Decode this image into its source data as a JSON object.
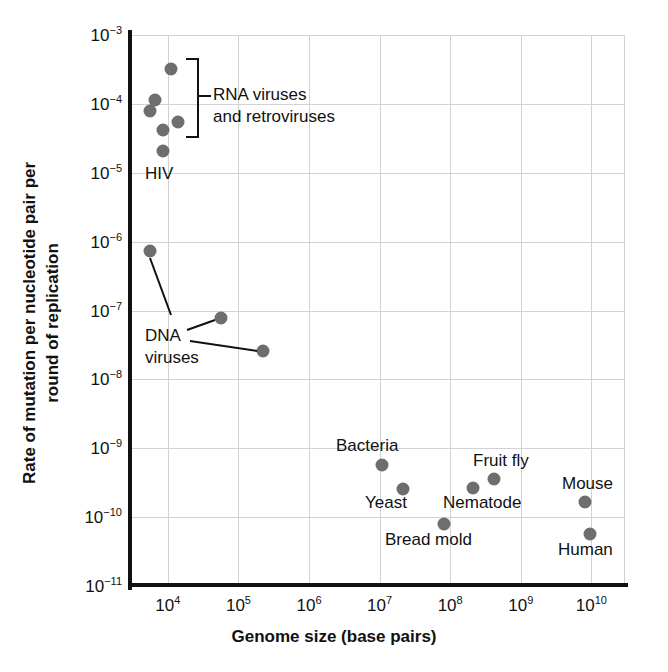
{
  "chart_data": {
    "type": "scatter",
    "title": "",
    "xlabel": "Genome size (base pairs)",
    "ylabel_line1": "Rate of mutation per nucleotide pair per",
    "ylabel_line2": "round of replication",
    "xscale": "log",
    "yscale": "log",
    "xlim": [
      3000,
      30000000000
    ],
    "ylim": [
      1e-11,
      0.001
    ],
    "grid": true,
    "legend": "none",
    "marker_color": "#6e6e6e",
    "xticks": [
      {
        "label": "10",
        "exp": "4",
        "value": 10000
      },
      {
        "label": "10",
        "exp": "5",
        "value": 100000
      },
      {
        "label": "10",
        "exp": "6",
        "value": 1000000
      },
      {
        "label": "10",
        "exp": "7",
        "value": 10000000
      },
      {
        "label": "10",
        "exp": "8",
        "value": 100000000
      },
      {
        "label": "10",
        "exp": "9",
        "value": 1000000000
      },
      {
        "label": "10",
        "exp": "10",
        "value": 10000000000
      }
    ],
    "yticks": [
      {
        "label": "10",
        "exp": "−3",
        "value": 0.001
      },
      {
        "label": "10",
        "exp": "−4",
        "value": 0.0001
      },
      {
        "label": "10",
        "exp": "−5",
        "value": 1e-05
      },
      {
        "label": "10",
        "exp": "−6",
        "value": 1e-06
      },
      {
        "label": "10",
        "exp": "−7",
        "value": 1e-07
      },
      {
        "label": "10",
        "exp": "−8",
        "value": 1e-08
      },
      {
        "label": "10",
        "exp": "−9",
        "value": 1e-09
      },
      {
        "label": "10",
        "exp": "−10",
        "value": 1e-10
      },
      {
        "label": "10",
        "exp": "−11",
        "value": 1e-11
      }
    ],
    "points": [
      {
        "name": "rna-virus-1",
        "group": "RNA viruses and retroviruses",
        "x": 11000,
        "y": 0.00026,
        "px": 171,
        "py": 69
      },
      {
        "name": "rna-virus-2",
        "group": "RNA viruses and retroviruses",
        "x": 7600,
        "y": 0.0001,
        "px": 155,
        "py": 100
      },
      {
        "name": "rna-virus-3",
        "group": "RNA viruses and retroviruses",
        "x": 6600,
        "y": 7.2e-05,
        "px": 150,
        "py": 111
      },
      {
        "name": "rna-virus-4",
        "group": "RNA viruses and retroviruses",
        "x": 9200,
        "y": 3.8e-05,
        "px": 163,
        "py": 130
      },
      {
        "name": "rna-virus-5",
        "group": "RNA viruses and retroviruses",
        "x": 13500,
        "y": 4.9e-05,
        "px": 178,
        "py": 122
      },
      {
        "name": "hiv",
        "group": "HIV",
        "x": 9200,
        "y": 1.9e-05,
        "px": 163,
        "py": 151
      },
      {
        "name": "dna-virus-1",
        "group": "DNA viruses",
        "x": 6600,
        "y": 6e-07,
        "px": 150,
        "py": 251
      },
      {
        "name": "dna-virus-2",
        "group": "DNA viruses",
        "x": 52000,
        "y": 7e-08,
        "px": 221,
        "py": 318
      },
      {
        "name": "dna-virus-3",
        "group": "DNA viruses",
        "x": 185000,
        "y": 2.2e-08,
        "px": 263,
        "py": 351
      },
      {
        "name": "bacteria",
        "group": "Bacteria",
        "x": 5000000,
        "y": 5.1e-10,
        "px": 382,
        "py": 465
      },
      {
        "name": "yeast",
        "group": "Yeast",
        "x": 12000000,
        "y": 2.1e-10,
        "px": 403,
        "py": 489
      },
      {
        "name": "bread-mold",
        "group": "Bread mold",
        "x": 40000000,
        "y": 6.5e-11,
        "px": 444,
        "py": 524
      },
      {
        "name": "nematode",
        "group": "Nematode",
        "x": 100000000,
        "y": 2.1e-10,
        "px": 473,
        "py": 488
      },
      {
        "name": "fruit-fly",
        "group": "Fruit fly",
        "x": 180000000,
        "y": 2.8e-10,
        "px": 494,
        "py": 479
      },
      {
        "name": "mouse",
        "group": "Mouse",
        "x": 2800000000,
        "y": 1.7e-10,
        "px": 585,
        "py": 502
      },
      {
        "name": "human",
        "group": "Human",
        "x": 3000000000,
        "y": 5.3e-11,
        "px": 590,
        "py": 534
      }
    ],
    "annotations": [
      {
        "name": "rna-viruses-label",
        "text_line1": "RNA viruses",
        "text_line2": "and retroviruses",
        "px": 213,
        "py": 84
      },
      {
        "name": "hiv-label",
        "text": "HIV",
        "px": 145,
        "py": 163
      },
      {
        "name": "dna-viruses-label",
        "text_line1": "DNA",
        "text_line2": "viruses",
        "px": 145,
        "py": 325
      },
      {
        "name": "bacteria-label",
        "text": "Bacteria",
        "px": 336,
        "py": 435
      },
      {
        "name": "yeast-label",
        "text": "Yeast",
        "px": 365,
        "py": 492
      },
      {
        "name": "bread-mold-label",
        "text": "Bread mold",
        "px": 385,
        "py": 529
      },
      {
        "name": "nematode-label",
        "text": "Nematode",
        "px": 443,
        "py": 492
      },
      {
        "name": "fruit-fly-label",
        "text": "Fruit fly",
        "px": 473,
        "py": 450
      },
      {
        "name": "mouse-label",
        "text": "Mouse",
        "px": 562,
        "py": 473
      },
      {
        "name": "human-label",
        "text": "Human",
        "px": 558,
        "py": 539
      }
    ]
  }
}
